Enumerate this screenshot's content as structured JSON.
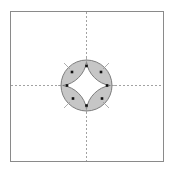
{
  "diagram": {
    "width": 172,
    "height": 171,
    "frame": {
      "x": 10.5,
      "y": 11.5,
      "w": 153,
      "h": 150,
      "stroke": "#888888"
    },
    "axes": {
      "cx": 86.5,
      "cy": 85.5,
      "stroke": "#888888",
      "dash": "2,2"
    },
    "circle": {
      "cx": 86.5,
      "cy": 85.5,
      "r": 25.5,
      "fill": "#c8c8c8",
      "stroke": "#777777"
    },
    "inner_region_fill": "#ffffff",
    "points": [
      {
        "id": "top",
        "x": 86.5,
        "y": 66
      },
      {
        "id": "bottom",
        "x": 86.5,
        "y": 105.5
      },
      {
        "id": "left",
        "x": 67,
        "y": 85.5
      },
      {
        "id": "right",
        "x": 107,
        "y": 85.5
      },
      {
        "id": "upper-left-lens",
        "x": 72,
        "y": 72
      },
      {
        "id": "upper-right-lens",
        "x": 101,
        "y": 72
      },
      {
        "id": "lower-left-lens",
        "x": 73,
        "y": 98.5
      },
      {
        "id": "lower-right-lens",
        "x": 102,
        "y": 98.5
      }
    ],
    "point_color": "#111111"
  }
}
